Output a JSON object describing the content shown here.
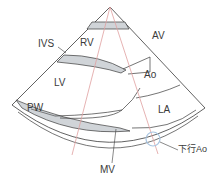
{
  "diagram": {
    "labels": {
      "rv": "RV",
      "ivs": "IVS",
      "av": "AV",
      "lv": "LV",
      "ao": "Ao",
      "la": "LA",
      "pw": "PW",
      "mv": "MV",
      "desc_ao": "下行Ao"
    },
    "colors": {
      "outline": "#3a3a3a",
      "wall_fill": "#d0d4d8",
      "beam_line": "#e0a0a0",
      "desc_ao_circle": "#a8c4e0"
    }
  }
}
